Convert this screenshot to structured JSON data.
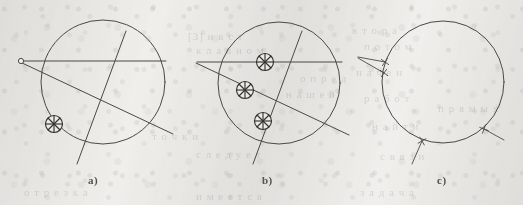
{
  "figure": {
    "width": 523,
    "height": 205,
    "background_color": "#f1f0ee",
    "ink_color": "#4b4845",
    "marker_color": "#35332f"
  },
  "panels": [
    {
      "id": "a",
      "label": "a)",
      "label_x": 88,
      "label_y": 174,
      "circle": {
        "cx": 103,
        "cy": 82,
        "r": 62
      },
      "lines": [
        {
          "name": "horizontal-chord",
          "x1": 21,
          "y1": 61,
          "x2": 166,
          "y2": 61
        },
        {
          "name": "steep-chord",
          "x1": 126,
          "y1": 31,
          "x2": 77,
          "y2": 164
        },
        {
          "name": "oblique-chord",
          "x1": 20,
          "y1": 62,
          "x2": 173,
          "y2": 134
        }
      ],
      "endpoints": [
        {
          "name": "open-endpoint",
          "cx": 21,
          "cy": 61,
          "r": 2.6
        }
      ],
      "markers": [
        {
          "name": "circled-cross-marker",
          "cx": 54,
          "cy": 124,
          "r": 8.5
        }
      ]
    },
    {
      "id": "b",
      "label": "b)",
      "label_x": 262,
      "label_y": 174,
      "circle": {
        "cx": 279,
        "cy": 83,
        "r": 61
      },
      "lines": [
        {
          "name": "horizontal-chord",
          "x1": 197,
          "y1": 62,
          "x2": 342,
          "y2": 62
        },
        {
          "name": "steep-chord",
          "x1": 302,
          "y1": 31,
          "x2": 253,
          "y2": 164
        },
        {
          "name": "oblique-chord",
          "x1": 196,
          "y1": 63,
          "x2": 349,
          "y2": 135
        }
      ],
      "endpoints": [],
      "markers": [
        {
          "name": "circled-cross-marker",
          "cx": 265,
          "cy": 62,
          "r": 8.5
        },
        {
          "name": "circled-cross-marker",
          "cx": 245,
          "cy": 90,
          "r": 8.5
        },
        {
          "name": "circled-cross-marker",
          "cx": 263,
          "cy": 121,
          "r": 8.5
        }
      ]
    },
    {
      "id": "c",
      "label": "c)",
      "label_x": 437,
      "label_y": 174,
      "circle": {
        "cx": 443,
        "cy": 82,
        "r": 61
      },
      "lines": [],
      "tangent_stubs": [
        {
          "name": "stub-upper-left",
          "x1": 385,
          "y1": 62,
          "x2": 358,
          "y2": 57
        },
        {
          "name": "stub-mid-left",
          "x1": 384,
          "y1": 73,
          "x2": 358,
          "y2": 58
        },
        {
          "name": "stub-bottom",
          "x1": 422,
          "y1": 141,
          "x2": 412,
          "y2": 164
        },
        {
          "name": "stub-lower-right",
          "x1": 484,
          "y1": 129,
          "x2": 504,
          "y2": 140
        }
      ],
      "tick_marks": [
        {
          "name": "tick-upper-left",
          "cx": 385,
          "cy": 62,
          "angle": 35
        },
        {
          "name": "tick-mid-left",
          "cx": 384,
          "cy": 73,
          "angle": 35
        },
        {
          "name": "tick-bottom",
          "cx": 422,
          "cy": 141,
          "angle": 60
        },
        {
          "name": "tick-lower-right",
          "cx": 484,
          "cy": 129,
          "angle": 20
        }
      ],
      "markers": []
    }
  ],
  "bleed_through_text": [
    {
      "text": "[3] и в с т",
      "x": 188,
      "y": 30
    },
    {
      "text": "к л а в н о м",
      "x": 196,
      "y": 44
    },
    {
      "text": "в т о р а",
      "x": 352,
      "y": 24
    },
    {
      "text": "п о т о м",
      "x": 364,
      "y": 40
    },
    {
      "text": "о п р е д",
      "x": 300,
      "y": 72
    },
    {
      "text": "н а ч е н",
      "x": 356,
      "y": 66
    },
    {
      "text": "н а ш е й",
      "x": 286,
      "y": 88
    },
    {
      "text": "р а б о т",
      "x": 364,
      "y": 92
    },
    {
      "text": "т о ч к и",
      "x": 152,
      "y": 130
    },
    {
      "text": "с л е д у е т",
      "x": 196,
      "y": 148
    },
    {
      "text": "н а й т и",
      "x": 372,
      "y": 120
    },
    {
      "text": "с в я з и",
      "x": 380,
      "y": 150
    },
    {
      "text": "о т р е з к а",
      "x": 24,
      "y": 186
    },
    {
      "text": "и м е е т с я",
      "x": 196,
      "y": 190
    },
    {
      "text": "з а д а ч а",
      "x": 360,
      "y": 186
    },
    {
      "text": "п р я м ы х",
      "x": 438,
      "y": 102
    }
  ]
}
